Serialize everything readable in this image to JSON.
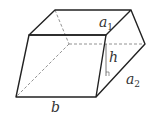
{
  "diagram": {
    "type": "oblique parallelepiped (prism) with labeled dimensions",
    "labels": {
      "a1": {
        "main": "a",
        "sub": "1"
      },
      "a2": {
        "main": "a",
        "sub": "2"
      },
      "h": "h",
      "b": "b"
    },
    "colors": {
      "edge": "#222222",
      "hidden_edge": "#777777",
      "label": "#333333",
      "background": "#ffffff"
    }
  }
}
